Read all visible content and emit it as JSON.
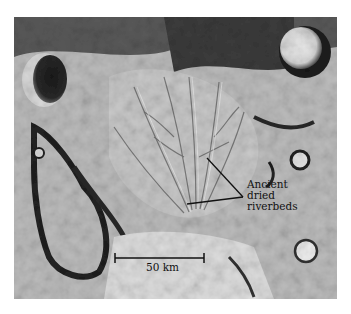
{
  "figure": {
    "annotation": {
      "lines": [
        "Ancient",
        "dried",
        "riverbeds"
      ]
    },
    "scale_bar": {
      "label": "50 km"
    },
    "colors": {
      "background": "#ffffff",
      "ink": "#111111"
    }
  }
}
